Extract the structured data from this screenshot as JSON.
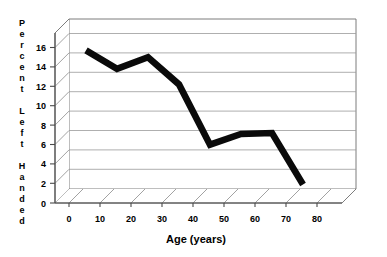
{
  "chart_data": {
    "type": "line",
    "title": "",
    "xlabel": "Age (years)",
    "ylabel": "Percent Left Handed",
    "x": [
      10,
      20,
      30,
      40,
      50,
      60,
      70,
      80
    ],
    "values": [
      15.7,
      13.8,
      15.0,
      12.2,
      6.0,
      7.1,
      7.2,
      1.9
    ],
    "series": [
      {
        "name": "Percent Left Handed",
        "values": [
          15.7,
          13.8,
          15.0,
          12.2,
          6.0,
          7.1,
          7.2,
          1.9
        ]
      }
    ],
    "xlim": [
      0,
      85
    ],
    "ylim": [
      0,
      17
    ],
    "x_ticks": [
      "0",
      "10",
      "20",
      "30",
      "40",
      "50",
      "60",
      "70",
      "80"
    ],
    "y_ticks": [
      "0",
      "2",
      "4",
      "6",
      "8",
      "10",
      "12",
      "14",
      "16"
    ],
    "grid": true,
    "legend": "none",
    "style": "3d-perspective",
    "line_color": "#0a0a0a",
    "grid_color": "#9a9a9a",
    "background_color": "#ffffff"
  },
  "axes": {
    "y_label_letters": [
      "P",
      "e",
      "r",
      "c",
      "e",
      "n",
      "t",
      "",
      "L",
      "e",
      "f",
      "t",
      "",
      "H",
      "a",
      "n",
      "d",
      "e",
      "d"
    ],
    "y_label_text": "Percent Left Handed",
    "x_label_text": "Age (years)"
  }
}
